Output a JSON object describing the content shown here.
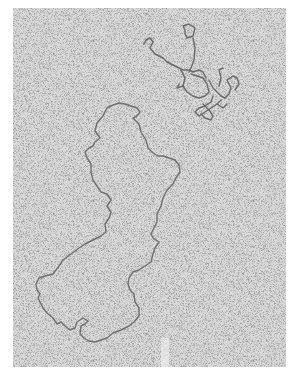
{
  "image": {
    "kind": "electron micrograph",
    "subject": "DNA molecules",
    "description": "Grayscale electron micrograph showing a large relaxed circular DNA molecule and a smaller supercoiled/tangled molecule on a speckled background",
    "colors": {
      "page_background": "#ffffff",
      "field_background": "#d9d9d9",
      "strand": "#6e6e6e",
      "speckle": "#555555"
    },
    "objects": [
      {
        "name": "large-relaxed-circular-dna",
        "region": "center-left to bottom"
      },
      {
        "name": "small-tangled-dna",
        "region": "upper-right"
      }
    ]
  }
}
